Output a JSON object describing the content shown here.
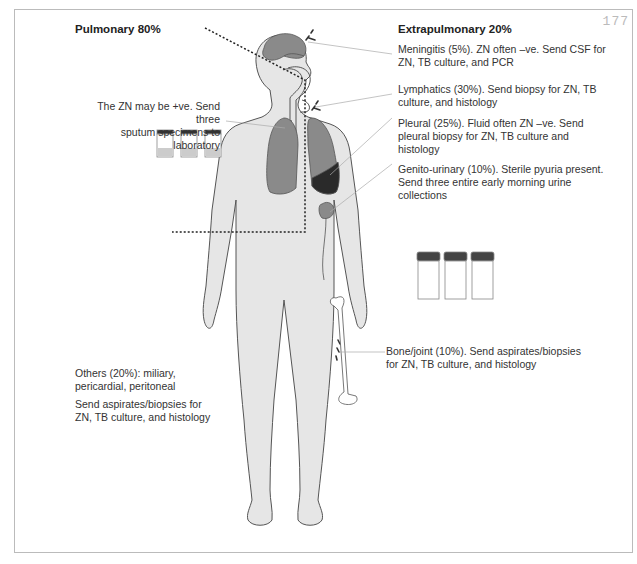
{
  "page_number": "177",
  "headings": {
    "pulmonary": "Pulmonary 80%",
    "extrapulmonary": "Extrapulmonary 20%"
  },
  "annotations": {
    "sputum": [
      "The ZN may be +ve. Send three",
      "sputum specimens to laboratory"
    ],
    "meningitis": [
      "Meningitis (5%). ZN often –ve. Send CSF for",
      "ZN, TB culture, and PCR"
    ],
    "lymphatics": [
      "Lymphatics (30%). Send biopsy for ZN, TB",
      "culture, and histology"
    ],
    "pleural": [
      "Pleural (25%). Fluid often ZN –ve. Send",
      "pleural biopsy for ZN, TB culture and",
      "histology"
    ],
    "genito": [
      "Genito-urinary (10%). Sterile pyuria present.",
      "Send three entire early morning urine",
      "collections"
    ],
    "bone": [
      "Bone/joint (10%). Send aspirates/biopsies",
      "for ZN, TB culture, and histology"
    ],
    "others": [
      "Others (20%): miliary,",
      "pericardial, peritoneal"
    ],
    "others_send": [
      "Send aspirates/biopsies for",
      "ZN, TB culture, and histology"
    ]
  },
  "colors": {
    "body": "#e6e6e6",
    "organ": "#8a8a8a",
    "dark_organ": "#2a2a2a",
    "outline": "#555555",
    "leader": "#aaaaaa"
  }
}
